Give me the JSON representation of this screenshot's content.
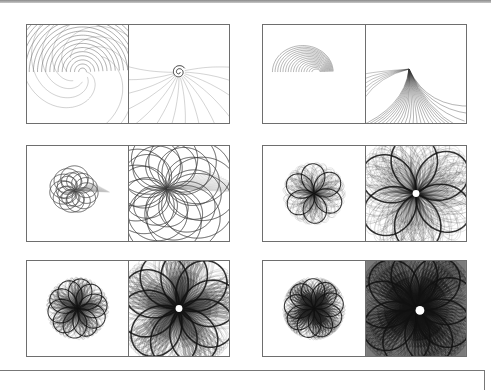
{
  "figure": {
    "rows": [
      {
        "pairs": [
          {
            "left": {
              "pattern": "spiral-arcs",
              "curves": 22,
              "ink": "#555555"
            },
            "right": {
              "pattern": "vortex-rays",
              "curves": 14,
              "ink": "#6a6a6a"
            }
          },
          {
            "left": {
              "pattern": "half-dome",
              "curves": 16,
              "ink": "#444444"
            },
            "right": {
              "pattern": "fan-sweep",
              "curves": 26,
              "ink": "#333333"
            }
          }
        ]
      },
      {
        "pairs": [
          {
            "left": {
              "pattern": "loop-knot",
              "petals": 7,
              "curves": 18,
              "ink": "#444444"
            },
            "right": {
              "pattern": "loop-knot-zoom",
              "petals": 7,
              "curves": 24,
              "ink": "#333333"
            }
          },
          {
            "left": {
              "pattern": "rose",
              "petals": 6,
              "curves": 40,
              "ink": "#333333"
            },
            "right": {
              "pattern": "rose-zoom",
              "petals": 6,
              "curves": 60,
              "ink": "#222222"
            }
          }
        ]
      },
      {
        "pairs": [
          {
            "left": {
              "pattern": "rose",
              "petals": 10,
              "curves": 50,
              "ink": "#333333"
            },
            "right": {
              "pattern": "rose-zoom",
              "petals": 10,
              "curves": 80,
              "ink": "#222222"
            }
          },
          {
            "left": {
              "pattern": "rose-dense",
              "petals": 9,
              "curves": 70,
              "ink": "#222222"
            },
            "right": {
              "pattern": "rose-dense-zoom",
              "petals": 9,
              "curves": 110,
              "ink": "#111111"
            }
          }
        ]
      }
    ]
  }
}
